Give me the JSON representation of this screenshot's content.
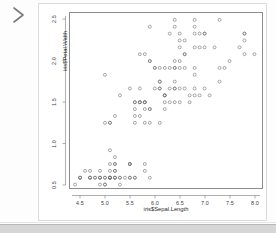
{
  "console": {
    "prompt_symbol": ">"
  },
  "plot": {
    "xlabel": "iris$Sepal.Length",
    "ylabel": "iris$Petal.Width",
    "x_ticks": [
      "4.5",
      "5.0",
      "5.5",
      "6.0",
      "6.5",
      "7.0",
      "7.5",
      "8.0"
    ],
    "y_ticks": [
      "0.5",
      "1.0",
      "1.5",
      "2.0",
      "2.5"
    ],
    "frame_color": "#8c8c8c",
    "point_color": "#6e6e6e",
    "panel_border_color": "#dcdcdc",
    "footer_color": "#d6d6d6"
  },
  "chart_data": {
    "type": "scatter",
    "title": "",
    "xlabel": "iris$Sepal.Length",
    "ylabel": "iris$Petal.Width",
    "xlim": [
      4.2,
      8.05
    ],
    "ylim": [
      0.05,
      2.6
    ],
    "x_ticks": [
      4.5,
      5.0,
      5.5,
      6.0,
      6.5,
      7.0,
      7.5,
      8.0
    ],
    "y_ticks": [
      0.5,
      1.0,
      1.5,
      2.0,
      2.5
    ],
    "grid": false,
    "legend": false,
    "marker": "open-circle",
    "x": [
      5.1,
      4.9,
      4.7,
      4.6,
      5.0,
      5.4,
      4.6,
      5.0,
      4.4,
      4.9,
      5.4,
      4.8,
      4.8,
      4.3,
      5.8,
      5.7,
      5.4,
      5.1,
      5.7,
      5.1,
      5.4,
      5.1,
      4.6,
      5.1,
      4.8,
      5.0,
      5.0,
      5.2,
      5.2,
      4.7,
      4.8,
      5.4,
      5.2,
      5.5,
      4.9,
      5.0,
      5.5,
      4.9,
      4.4,
      5.1,
      5.0,
      4.5,
      4.4,
      5.0,
      5.1,
      4.8,
      5.1,
      4.6,
      5.3,
      5.0,
      7.0,
      6.4,
      6.9,
      5.5,
      6.5,
      5.7,
      6.3,
      4.9,
      6.6,
      5.2,
      5.0,
      5.9,
      6.0,
      6.1,
      5.6,
      6.7,
      5.6,
      5.8,
      6.2,
      5.6,
      5.9,
      6.1,
      6.3,
      6.1,
      6.4,
      6.6,
      6.8,
      6.7,
      6.0,
      5.7,
      5.5,
      5.5,
      5.8,
      6.0,
      5.4,
      6.0,
      6.7,
      6.3,
      5.6,
      5.5,
      5.5,
      6.1,
      5.8,
      5.0,
      5.6,
      5.7,
      5.7,
      6.2,
      5.1,
      5.7,
      6.3,
      5.8,
      7.1,
      6.3,
      6.5,
      7.6,
      4.9,
      7.3,
      6.7,
      7.2,
      6.5,
      6.4,
      6.8,
      5.7,
      5.8,
      6.4,
      6.5,
      7.7,
      7.7,
      6.0,
      6.9,
      5.6,
      7.7,
      6.3,
      6.7,
      7.2,
      6.2,
      6.1,
      6.4,
      7.2,
      7.4,
      7.9,
      6.4,
      6.3,
      6.1,
      7.7,
      6.3,
      6.4,
      6.0,
      6.9,
      6.7,
      6.9,
      5.8,
      6.8,
      6.7,
      6.7,
      6.3,
      6.5,
      6.2,
      5.9
    ],
    "y": [
      0.2,
      0.2,
      0.2,
      0.2,
      0.2,
      0.4,
      0.3,
      0.2,
      0.2,
      0.1,
      0.2,
      0.2,
      0.1,
      0.1,
      0.2,
      0.4,
      0.4,
      0.3,
      0.3,
      0.3,
      0.2,
      0.4,
      0.2,
      0.5,
      0.2,
      0.2,
      0.4,
      0.2,
      0.2,
      0.2,
      0.2,
      0.4,
      0.1,
      0.2,
      0.2,
      0.2,
      0.2,
      0.1,
      0.2,
      0.2,
      0.3,
      0.3,
      0.2,
      0.6,
      0.4,
      0.3,
      0.2,
      0.2,
      0.2,
      0.2,
      1.4,
      1.5,
      1.5,
      1.3,
      1.5,
      1.3,
      1.6,
      1.0,
      1.3,
      1.4,
      1.0,
      1.5,
      1.0,
      1.4,
      1.3,
      1.4,
      1.5,
      1.0,
      1.5,
      1.1,
      1.8,
      1.3,
      1.5,
      1.2,
      1.3,
      1.4,
      1.4,
      1.7,
      1.5,
      1.0,
      1.1,
      1.0,
      1.2,
      1.6,
      1.5,
      1.6,
      1.5,
      1.3,
      1.3,
      1.3,
      1.2,
      1.4,
      1.2,
      1.0,
      1.3,
      1.2,
      1.3,
      1.3,
      1.1,
      1.3,
      2.5,
      1.9,
      2.1,
      1.8,
      2.2,
      2.1,
      1.7,
      1.8,
      1.8,
      2.5,
      2.0,
      1.9,
      2.1,
      2.0,
      2.4,
      2.3,
      1.8,
      2.2,
      2.3,
      1.5,
      2.3,
      2.0,
      2.0,
      1.8,
      2.1,
      1.8,
      1.8,
      1.8,
      2.1,
      1.6,
      1.9,
      2.0,
      2.2,
      1.5,
      1.4,
      2.3,
      2.4,
      1.8,
      1.8,
      2.1,
      2.4,
      2.3,
      1.9,
      2.3,
      2.5,
      2.3,
      1.9,
      2.0,
      2.3,
      1.8
    ]
  }
}
